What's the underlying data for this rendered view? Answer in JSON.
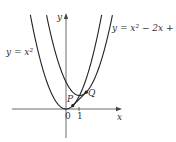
{
  "chart_data": {
    "type": "line",
    "title": "",
    "xlabel": "x",
    "ylabel": "y",
    "series": [
      {
        "name": "y = x^2",
        "label": "y = x²",
        "expr": "x^2"
      },
      {
        "name": "y = x^2 - 2x + 2",
        "label": "y = x² − 2x + 2",
        "expr": "x^2-2x+2"
      }
    ],
    "points": [
      {
        "name": "P",
        "x": 0.5,
        "y": 0.25
      },
      {
        "name": "Q",
        "x": 1.5,
        "y": 1.25
      }
    ],
    "x_ticks": [
      "0",
      "1"
    ],
    "grid": false
  },
  "labels": {
    "y_axis": "y",
    "x_axis": "x",
    "curve1": "y = x²",
    "curve2": "y = x² − 2x + 2",
    "origin": "0",
    "tick1": "1",
    "P": "P",
    "Q": "Q"
  }
}
